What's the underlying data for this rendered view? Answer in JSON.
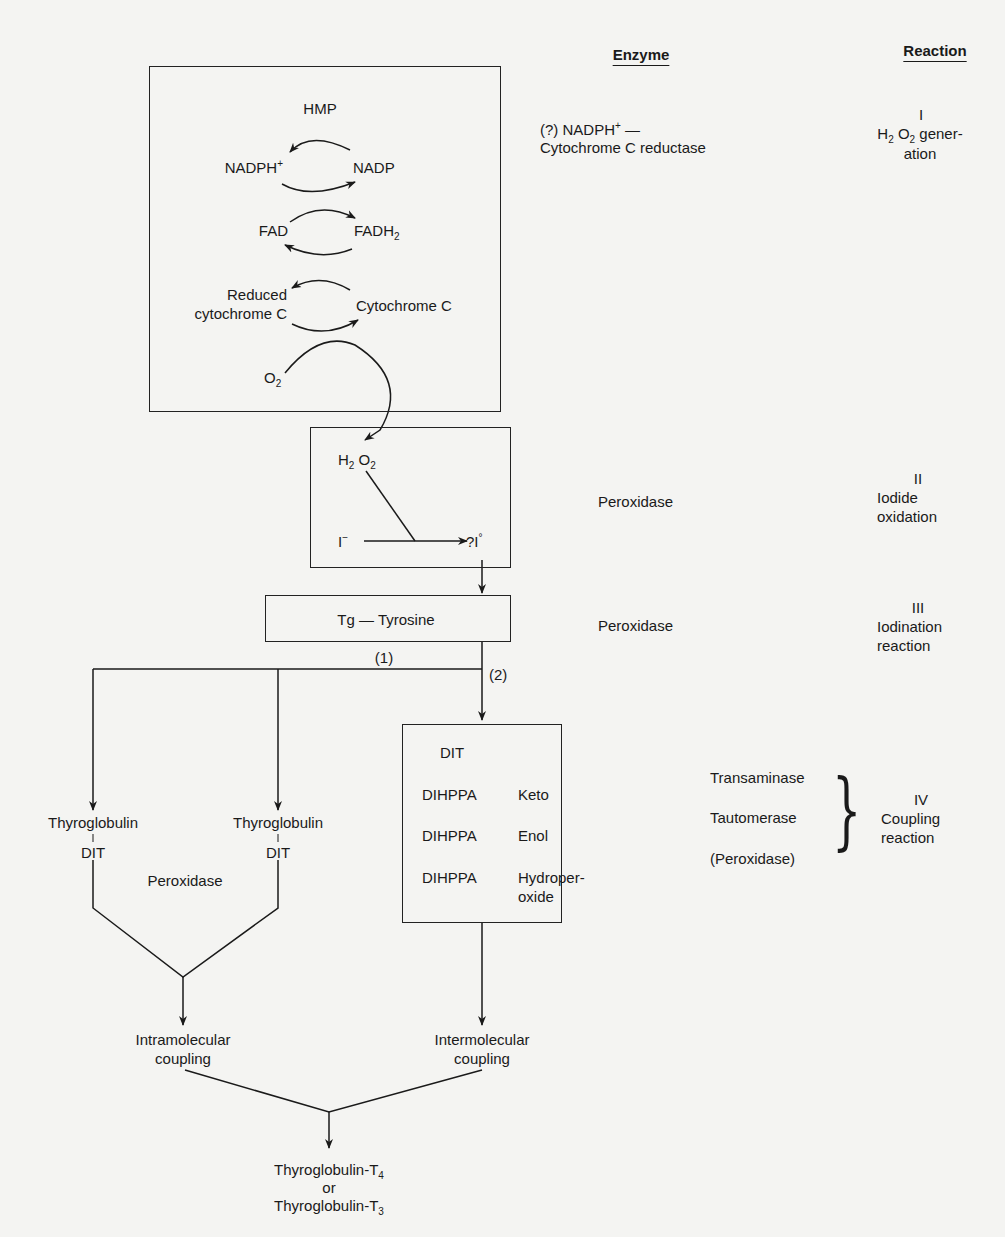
{
  "headers": {
    "enzyme": "Enzyme",
    "reaction": "Reaction"
  },
  "hmp_box": {
    "title": "HMP",
    "nadph": "NADPH",
    "nadph_sup": "+",
    "nadp": "NADP",
    "fad": "FAD",
    "fadh": "FADH",
    "fadh_sub": "2",
    "reduced_1": "Reduced",
    "reduced_2": "cytochrome C",
    "cytochrome": "Cytochrome C",
    "o": "O",
    "o_sub": "2"
  },
  "h2o2_box": {
    "h": "H",
    "h_sub": "2",
    "o": " O",
    "o_sub": "2",
    "iodide": "I",
    "iodide_sup": "−",
    "iodine": "?I",
    "iodine_sup": "°"
  },
  "tg_box": {
    "label": "Tg — Tyrosine"
  },
  "branch_labels": {
    "one": "(1)",
    "two": "(2)"
  },
  "dit_box": {
    "rows": [
      {
        "a": "DIT",
        "b": ""
      },
      {
        "a": "DIHPPA",
        "b": "Keto"
      },
      {
        "a": "DIHPPA",
        "b": "Enol"
      },
      {
        "a": "DIHPPA",
        "b": "Hydroper-",
        "b2": "oxide"
      }
    ]
  },
  "left_branch": {
    "thyro_1": "Thyroglobulin",
    "dit_1": "DIT",
    "thyro_2": "Thyroglobulin",
    "dit_2": "DIT",
    "peroxidase": "Peroxidase",
    "intra_1": "Intramolecular",
    "intra_2": "coupling"
  },
  "right_branch": {
    "inter_1": "Intermolecular",
    "inter_2": "coupling"
  },
  "final": {
    "line1": "Thyroglobulin-T",
    "line1_sub": "4",
    "or": "or",
    "line3": "Thyroglobulin-T",
    "line3_sub": "3"
  },
  "enzymes": {
    "i_1": "(?) NADPH",
    "i_1_sup": "+",
    "i_1_tail": " —",
    "i_2": "Cytochrome C reductase",
    "ii": "Peroxidase",
    "iii": "Peroxidase",
    "iv": [
      "Transaminase",
      "Tautomerase",
      "(Peroxidase)"
    ]
  },
  "reactions": {
    "i_num": "I",
    "i_h": "H",
    "i_h_sub": "2",
    "i_o": " O",
    "i_o_sub": "2",
    "i_tail": " gener-",
    "i_2": "ation",
    "ii_num": "II",
    "ii_1": "Iodide",
    "ii_2": "oxidation",
    "iii_num": "III",
    "iii_1": "Iodination",
    "iii_2": "reaction",
    "iv_num": "IV",
    "iv_1": "Coupling",
    "iv_2": "reaction"
  }
}
